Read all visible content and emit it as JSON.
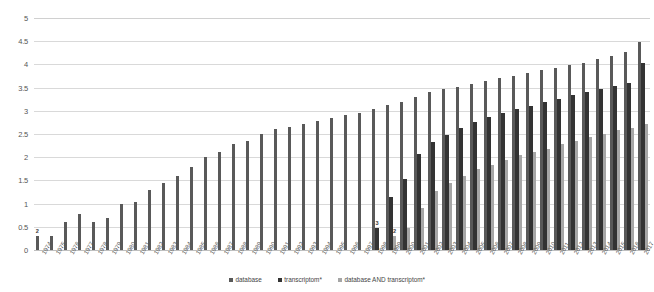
{
  "chart_data": {
    "type": "bar",
    "title": "",
    "xlabel": "",
    "ylabel": "",
    "ylim": [
      0,
      5
    ],
    "grid": true,
    "legend_position": "bottom",
    "ytick_labels": [
      "0",
      "0.5",
      "1",
      "1.5",
      "2",
      "2.5",
      "3",
      "3.5",
      "4",
      "4.5",
      "5"
    ],
    "ytick_values": [
      0,
      0.5,
      1,
      1.5,
      2,
      2.5,
      3,
      3.5,
      4,
      4.5,
      5
    ],
    "categories": [
      "1974",
      "1975",
      "1976",
      "1977",
      "1978",
      "1979",
      "1980",
      "1981",
      "1982",
      "1983",
      "1984",
      "1985",
      "1986",
      "1987",
      "1988",
      "1989",
      "1990",
      "1991",
      "1992",
      "1993",
      "1994",
      "1995",
      "1996",
      "1997",
      "1998",
      "1999",
      "2000",
      "2001",
      "2002",
      "2003",
      "2004",
      "2005",
      "2006",
      "2007",
      "2008",
      "2009",
      "2010",
      "2011",
      "2012",
      "2013",
      "2014",
      "2015",
      "2016",
      "2017"
    ],
    "series": [
      {
        "name": "database",
        "color": "#595959",
        "values": [
          0.3,
          0.3,
          0.6,
          0.78,
          0.6,
          0.7,
          1.0,
          1.04,
          1.3,
          1.45,
          1.6,
          1.78,
          2.0,
          2.11,
          2.28,
          2.36,
          2.49,
          2.6,
          2.66,
          2.72,
          2.78,
          2.85,
          2.92,
          2.96,
          3.04,
          3.12,
          3.2,
          3.3,
          3.4,
          3.46,
          3.52,
          3.58,
          3.64,
          3.7,
          3.76,
          3.82,
          3.88,
          3.92,
          3.98,
          4.04,
          4.12,
          4.18,
          4.26,
          4.48
        ]
      },
      {
        "name": "transcriptom*",
        "color": "#333333",
        "values": [
          null,
          null,
          null,
          null,
          null,
          null,
          null,
          null,
          null,
          null,
          null,
          null,
          null,
          null,
          null,
          null,
          null,
          null,
          null,
          null,
          null,
          null,
          null,
          null,
          0.48,
          1.15,
          1.53,
          2.08,
          2.32,
          2.48,
          2.62,
          2.76,
          2.86,
          2.95,
          3.04,
          3.11,
          3.18,
          3.26,
          3.34,
          3.4,
          3.46,
          3.54,
          3.6,
          4.04
        ]
      },
      {
        "name": "database AND transcriptom*",
        "color": "#a6a6a6",
        "values": [
          null,
          null,
          null,
          null,
          null,
          null,
          null,
          null,
          null,
          null,
          null,
          null,
          null,
          null,
          null,
          null,
          null,
          null,
          null,
          null,
          null,
          null,
          null,
          null,
          null,
          0.3,
          0.48,
          0.9,
          1.28,
          1.45,
          1.6,
          1.74,
          1.83,
          1.95,
          2.04,
          2.11,
          2.18,
          2.28,
          2.36,
          2.43,
          2.51,
          2.58,
          2.62,
          2.72
        ]
      }
    ],
    "point_labels": [
      {
        "category": "1974",
        "series": "database",
        "text": "2"
      },
      {
        "category": "1998",
        "series": "transcriptom*",
        "text": "3"
      },
      {
        "category": "1999",
        "series": "database AND transcriptom*",
        "text": "2"
      }
    ]
  },
  "legend": {
    "items": [
      {
        "label": "database"
      },
      {
        "label": "transcriptom*"
      },
      {
        "label": "database AND transcriptom*"
      }
    ]
  }
}
